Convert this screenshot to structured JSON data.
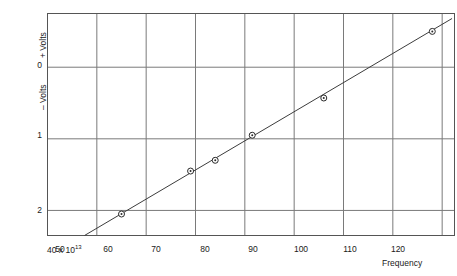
{
  "chart_data": {
    "type": "scatter",
    "title": "",
    "subtitle": "",
    "xlabel": "Frequency",
    "ylabel": "Volts",
    "y_axis_upper_label": "+ Volts",
    "y_axis_lower_label": "– Volts",
    "x_first_tick_label": "40 x 10",
    "x_first_tick_exponent": "13",
    "x_units_note": "40 x 10^13",
    "xticks": [
      40,
      50,
      60,
      70,
      80,
      90,
      100,
      110,
      120
    ],
    "xtick_labels": [
      "40 x 10¹³",
      "50",
      "60",
      "70",
      "80",
      "90",
      "100",
      "110",
      "120"
    ],
    "yticks": [
      0,
      1,
      2
    ],
    "ytick_labels": [
      "0",
      "1",
      "2"
    ],
    "xlim": [
      40,
      122.5
    ],
    "ylim": [
      -0.75,
      2.35
    ],
    "y_axis_inverted": true,
    "grid": true,
    "grid_color": "#7a7a7a",
    "legend": "none",
    "line_color": "#3c3c3c",
    "marker_color": "#2b2b2b",
    "series": [
      {
        "name": "Stopping voltage vs frequency",
        "x": [
          55.0,
          69.0,
          74.0,
          81.5,
          96.0,
          118.0
        ],
        "y": [
          2.05,
          1.45,
          1.3,
          0.95,
          0.43,
          -0.5
        ],
        "point_labels": [
          "",
          "",
          "",
          "",
          "",
          ""
        ]
      }
    ],
    "fit_line": {
      "name": "best fit line",
      "x_start": 47.5,
      "y_start": 2.35,
      "x_end": 122.0,
      "y_end": -0.68
    }
  },
  "figure": {
    "background_color": "#ffffff",
    "frame_color": "#555555"
  }
}
